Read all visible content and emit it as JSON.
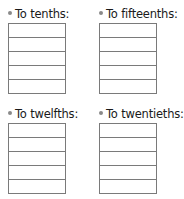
{
  "exercises": [
    {
      "label": "To tenths:",
      "rows": 5
    },
    {
      "label": "To fifteenths:",
      "rows": 5
    },
    {
      "label": "To twelfths:",
      "rows": 5
    },
    {
      "label": "To twentieths:",
      "rows": 5
    }
  ],
  "colors": {
    "bullet": "#8a8a8a",
    "border": "#7a7a7a",
    "text": "#1a1a1a"
  }
}
